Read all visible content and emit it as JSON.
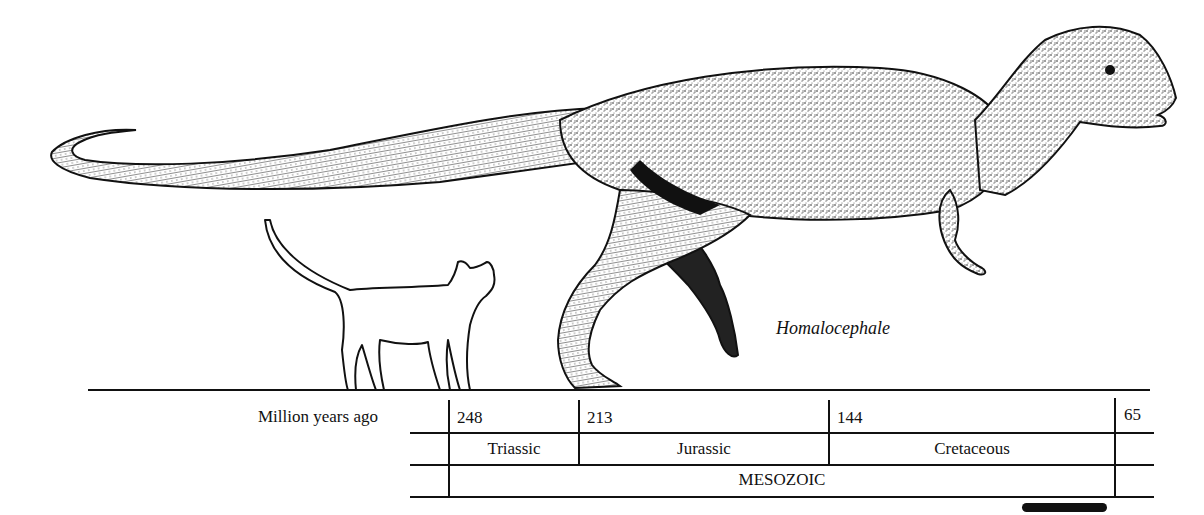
{
  "figure": {
    "species_label": "Homalocephale",
    "comparison_animal": "cat",
    "illustration": "homalocephale-dinosaur"
  },
  "timeline": {
    "axis_label": "Million years ago",
    "boundaries": [
      "248",
      "213",
      "144",
      "65"
    ],
    "periods": [
      {
        "name": "Triassic",
        "start": "248",
        "end": "213"
      },
      {
        "name": "Jurassic",
        "start": "213",
        "end": "144"
      },
      {
        "name": "Cretaceous",
        "start": "144",
        "end": "65"
      }
    ],
    "era": "MESOZOIC"
  },
  "scale_bar": {
    "present": true,
    "color": "#111111"
  },
  "colors": {
    "ink": "#111111",
    "paper": "#ffffff"
  }
}
